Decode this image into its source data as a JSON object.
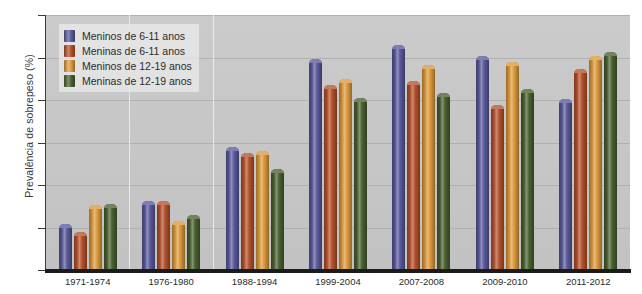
{
  "chart_data": {
    "type": "bar",
    "title": "",
    "xlabel": "",
    "ylabel": "Prevalência de sobrepeso (%)",
    "ylim": [
      0,
      24
    ],
    "ytick_labels": [
      "0",
      "4",
      "8",
      "12",
      "16",
      "20",
      "24"
    ],
    "yticks": [
      0,
      4,
      8,
      12,
      16,
      20,
      24
    ],
    "grid": true,
    "legend_position": "upper-left",
    "categories": [
      "1971-1974",
      "1976-1980",
      "1988-1994",
      "1999-2004",
      "2007-2008",
      "2009-2010",
      "2011-2012"
    ],
    "series": [
      {
        "name": "Meninos de 6-11 anos",
        "color": "#5a5a9c",
        "values": [
          4.3,
          6.5,
          11.6,
          19.9,
          21.2,
          20.1,
          16.1
        ]
      },
      {
        "name": "Meninas de 6-11 anos",
        "color": "#b5522c",
        "values": [
          3.6,
          6.5,
          11.0,
          17.4,
          17.8,
          15.5,
          18.9
        ]
      },
      {
        "name": "Meninos de 12-19 anos",
        "color": "#dd9a3c",
        "values": [
          6.1,
          4.6,
          11.2,
          18.0,
          19.3,
          19.6,
          20.1
        ]
      },
      {
        "name": "Meninas de 12-19 anos",
        "color": "#4a6130",
        "values": [
          6.2,
          5.2,
          9.5,
          16.2,
          16.7,
          17.0,
          20.5
        ]
      }
    ]
  },
  "colors": {
    "plot_background": "#c9c9c9",
    "gridline": "#b0b0b0",
    "axis": "#1b1b1b",
    "divider": "#ececd8"
  }
}
